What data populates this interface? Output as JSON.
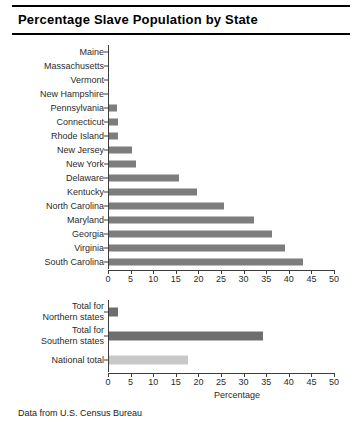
{
  "chart_data": {
    "type": "bar",
    "orientation": "horizontal",
    "title": "Percentage Slave Population by State",
    "xlabel": "Percentage",
    "ylabel": "",
    "xlim": [
      0,
      50
    ],
    "xticks": [
      0,
      5,
      10,
      15,
      20,
      25,
      30,
      35,
      40,
      45,
      50
    ],
    "grid": false,
    "legend": null,
    "panels": [
      {
        "name": "states",
        "categories": [
          "Maine",
          "Massachusetts",
          "Vermont",
          "New Hampshire",
          "Pennsylvania",
          "Connecticut",
          "Rhode Island",
          "New Jersey",
          "New York",
          "Delaware",
          "Kentucky",
          "North Carolina",
          "Maryland",
          "Georgia",
          "Virginia",
          "South Carolina"
        ],
        "values": [
          0,
          0,
          0,
          0,
          1.7,
          2.0,
          2.0,
          5.0,
          6.0,
          15.5,
          19.5,
          25.5,
          32.0,
          36.0,
          39.0,
          43.0
        ],
        "colors": [
          "#7d7d7d",
          "#7d7d7d",
          "#7d7d7d",
          "#7d7d7d",
          "#7d7d7d",
          "#7d7d7d",
          "#7d7d7d",
          "#7d7d7d",
          "#7d7d7d",
          "#7d7d7d",
          "#7d7d7d",
          "#7d7d7d",
          "#7d7d7d",
          "#7d7d7d",
          "#7d7d7d",
          "#7d7d7d"
        ]
      },
      {
        "name": "totals",
        "categories": [
          "Total for\nNorthern states",
          "Total for\nSouthern states",
          "National total"
        ],
        "values": [
          2.0,
          34.0,
          17.5
        ],
        "colors": [
          "#6e6e6e",
          "#6e6e6e",
          "#c8c8c8"
        ]
      }
    ]
  },
  "footer": {
    "source_note": "Data from U.S. Census Bureau"
  },
  "style": {
    "bar_color": "#7d7d7d",
    "bar_color_dark": "#6e6e6e",
    "bar_color_light": "#c8c8c8",
    "axis_color": "#3c3c3c",
    "text_color": "#2b2b2b",
    "background": "#ffffff"
  }
}
